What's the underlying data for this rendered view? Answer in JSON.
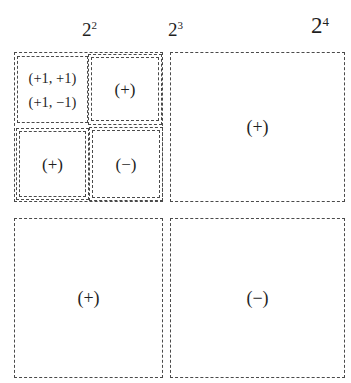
{
  "diagram": {
    "background_color": "#ffffff",
    "line_color": "#4a4a4a",
    "text_color": "#1f1f1f"
  },
  "axis_labels": [
    {
      "name": "pow-2-2",
      "base": "2",
      "exponent": "2",
      "text": "2^2"
    },
    {
      "name": "pow-2-3",
      "base": "2",
      "exponent": "3",
      "text": "2^3"
    },
    {
      "name": "pow-2-4",
      "base": "2",
      "exponent": "4",
      "text": "2^4"
    }
  ],
  "nested_block": {
    "label": "2^2",
    "cells": {
      "top_left": {
        "coords": [
          "(+1, +1)",
          "(+1, −1)"
        ]
      },
      "top_right": {
        "sign": "(+)"
      },
      "bottom_left": {
        "sign": "(+)"
      },
      "bottom_right": {
        "sign": "(−)"
      }
    }
  },
  "main_cells": {
    "top_right": {
      "sign": "(+)"
    },
    "bottom_left": {
      "sign": "(+)"
    },
    "bottom_right": {
      "sign": "(−)"
    }
  }
}
